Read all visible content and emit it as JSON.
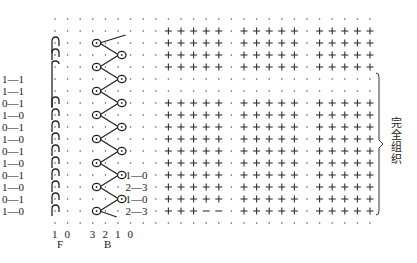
{
  "diagram": {
    "grid": {
      "origin_x": 55,
      "origin_y": 19,
      "col_step": 12.6,
      "row_step": 12,
      "cols": 26,
      "rows": 18,
      "plus_cols": [
        9,
        10,
        11,
        12,
        13,
        15,
        16,
        17,
        18,
        19,
        21,
        22,
        23,
        24,
        25
      ],
      "plus_rows": [
        1,
        2,
        3,
        4,
        7,
        8,
        9,
        10,
        11,
        12,
        13,
        14,
        15,
        16
      ],
      "dash_cells": [
        [
          16,
          12
        ],
        [
          16,
          13
        ]
      ],
      "suppressed_cells": [
        [
          13,
          6
        ],
        [
          13,
          7
        ],
        [
          14,
          6
        ],
        [
          14,
          7
        ],
        [
          15,
          6
        ],
        [
          15,
          7
        ],
        [
          16,
          6
        ],
        [
          16,
          7
        ]
      ]
    },
    "left_labels": {
      "start_row": 5,
      "items": [
        "1—1",
        "1—1",
        "0—1",
        "1—0",
        "0—1",
        "1—0",
        "0—1",
        "1—0",
        "0—1",
        "1—0",
        "0—1",
        "1—0"
      ]
    },
    "right_labels": {
      "start_row": 13,
      "items": [
        "1—0",
        "2—3",
        "1—0",
        "2—3"
      ]
    },
    "f_columns": [
      "1",
      "0"
    ],
    "b_columns": [
      "3",
      "2",
      "1",
      "0"
    ],
    "f_label": "F",
    "b_label": "B",
    "bracket_label": [
      "完",
      "全",
      "组",
      "织"
    ],
    "bracket_rows": [
      5,
      16
    ],
    "f_loops": {
      "pattern_rows": [
        2,
        3,
        7,
        8,
        9,
        10,
        11,
        12,
        13,
        14,
        15,
        16
      ]
    },
    "b_loops": {
      "rows": [
        2,
        3,
        4,
        5,
        6,
        7,
        8,
        9,
        10,
        11,
        12,
        13,
        14,
        15,
        16
      ],
      "left_loop_rows": [
        2,
        4,
        6,
        8,
        10,
        12,
        14,
        16
      ],
      "right_loop_rows": [
        3,
        5,
        7,
        9,
        11,
        13,
        15
      ]
    }
  }
}
